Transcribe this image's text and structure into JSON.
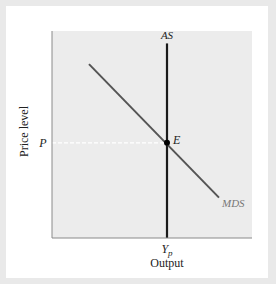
{
  "chart_data": {
    "type": "line",
    "title": "",
    "xlabel": "Output",
    "ylabel": "Price level",
    "xlim": [
      0,
      10
    ],
    "ylim": [
      0,
      10
    ],
    "grid": false,
    "legend": "none",
    "x_ticks": [
      {
        "value": 5.75,
        "label": "Y",
        "sub": "p"
      }
    ],
    "y_ticks": [
      {
        "value": 4.6,
        "label": "P"
      }
    ],
    "series": [
      {
        "name": "AS",
        "label": "AS",
        "points": [
          [
            5.75,
            0
          ],
          [
            5.75,
            9.4
          ]
        ],
        "color": "#1a1a1a"
      },
      {
        "name": "MDS",
        "label": "MDS",
        "points": [
          [
            1.85,
            8.4
          ],
          [
            8.35,
            1.95
          ]
        ],
        "color": "#555555"
      }
    ],
    "reference_lines": [
      {
        "name": "price-level-guide",
        "points": [
          [
            0,
            4.6
          ],
          [
            5.75,
            4.6
          ]
        ],
        "style": "dashed",
        "color": "#ffffff"
      }
    ],
    "annotations": [
      {
        "name": "equilibrium",
        "label": "E",
        "point": [
          5.75,
          4.6
        ]
      }
    ]
  }
}
